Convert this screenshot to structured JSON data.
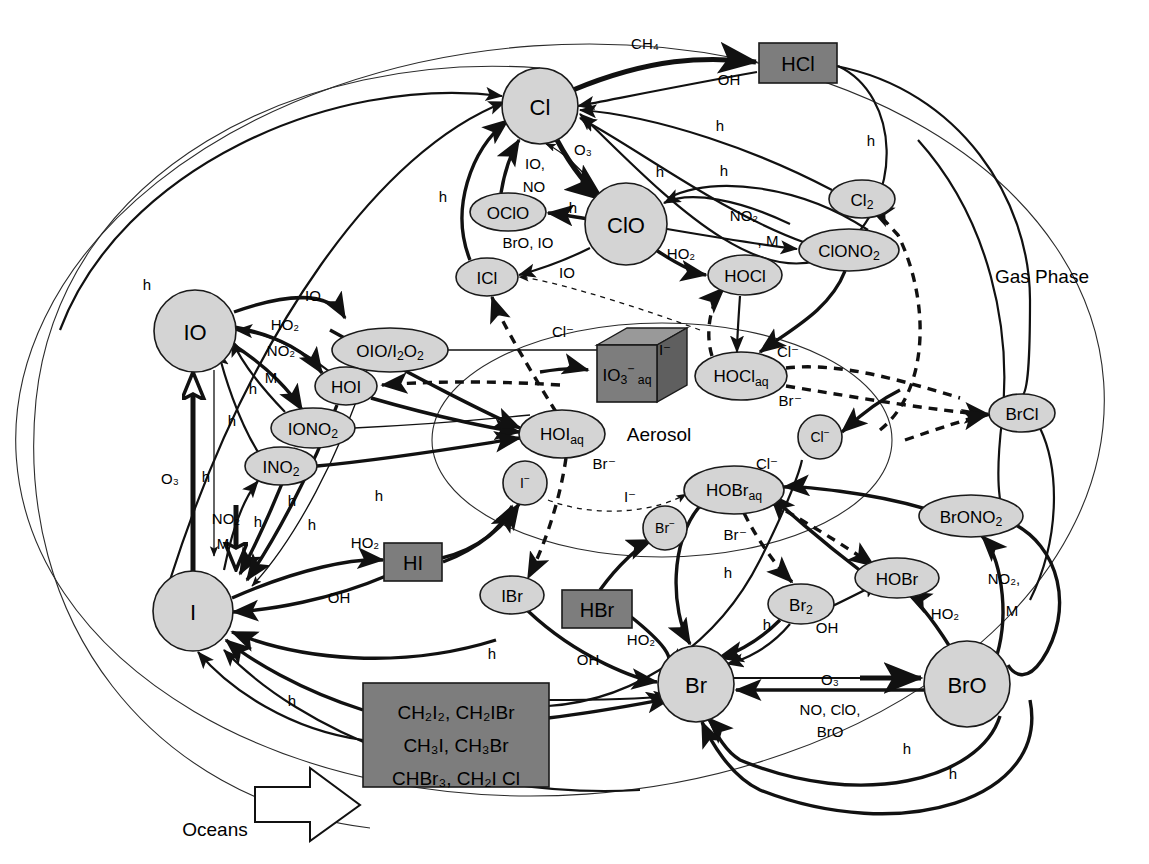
{
  "diagram": {
    "regions": [
      {
        "id": "gas_phase",
        "label": "Gas Phase",
        "x": 1042,
        "y": 276
      },
      {
        "id": "aerosol",
        "label": "Aerosol",
        "x": 659,
        "y": 434
      },
      {
        "id": "oceans",
        "label": "Oceans",
        "x": 215,
        "y": 829
      }
    ],
    "colors": {
      "node_light": "#d4d4d4",
      "node_dark": "#7d7d7d",
      "stroke": "#111111",
      "background": "#ffffff"
    },
    "nodes": [
      {
        "id": "Cl",
        "label": "Cl",
        "shape": "circle",
        "x": 540,
        "y": 106,
        "rx": 38,
        "ry": 38,
        "tone": "light"
      },
      {
        "id": "ClO",
        "label": "ClO",
        "shape": "circle",
        "x": 626,
        "y": 224,
        "rx": 41,
        "ry": 41,
        "tone": "light"
      },
      {
        "id": "OClO",
        "label": "OClO",
        "shape": "ellipse",
        "x": 508,
        "y": 212,
        "rx": 38,
        "ry": 19,
        "tone": "light"
      },
      {
        "id": "ICl",
        "label": "ICl",
        "shape": "ellipse",
        "x": 487,
        "y": 277,
        "rx": 31,
        "ry": 19,
        "tone": "light"
      },
      {
        "id": "HCl",
        "label": "HCl",
        "shape": "box",
        "x": 798,
        "y": 63,
        "rx": 39,
        "ry": 20,
        "tone": "dark"
      },
      {
        "id": "Cl2",
        "label": "Cl₂",
        "shape": "ellipse",
        "x": 862,
        "y": 199,
        "rx": 33,
        "ry": 19,
        "tone": "light"
      },
      {
        "id": "ClONO2",
        "label": "ClONO₂",
        "shape": "ellipse",
        "x": 849,
        "y": 250,
        "rx": 48,
        "ry": 21,
        "tone": "light"
      },
      {
        "id": "HOCl",
        "label": "HOCl",
        "shape": "ellipse",
        "x": 745,
        "y": 275,
        "rx": 37,
        "ry": 20,
        "tone": "light"
      },
      {
        "id": "HOClaq",
        "label": "HOCl_aq",
        "shape": "ellipse",
        "x": 741,
        "y": 376,
        "rx": 45,
        "ry": 23,
        "tone": "light"
      },
      {
        "id": "Clminus",
        "label": "Cl⁻",
        "shape": "circle",
        "x": 820,
        "y": 437,
        "rx": 22,
        "ry": 22,
        "tone": "light"
      },
      {
        "id": "IO",
        "label": "IO",
        "shape": "circle",
        "x": 195,
        "y": 331,
        "rx": 41,
        "ry": 41,
        "tone": "light"
      },
      {
        "id": "I",
        "label": "I",
        "shape": "circle",
        "x": 193,
        "y": 611,
        "rx": 40,
        "ry": 40,
        "tone": "light"
      },
      {
        "id": "OIO_I2O2",
        "label": "OIO/I₂O₂",
        "shape": "ellipse",
        "x": 390,
        "y": 350,
        "rx": 57,
        "ry": 22,
        "tone": "light"
      },
      {
        "id": "HOI",
        "label": "HOI",
        "shape": "ellipse",
        "x": 346,
        "y": 386,
        "rx": 31,
        "ry": 19,
        "tone": "light"
      },
      {
        "id": "IONO2",
        "label": "IONO₂",
        "shape": "ellipse",
        "x": 313,
        "y": 428,
        "rx": 41,
        "ry": 20,
        "tone": "light"
      },
      {
        "id": "INO2",
        "label": "INO₂",
        "shape": "ellipse",
        "x": 281,
        "y": 466,
        "rx": 36,
        "ry": 19,
        "tone": "light"
      },
      {
        "id": "HI",
        "label": "HI",
        "shape": "box",
        "x": 413,
        "y": 562,
        "rx": 29,
        "ry": 19,
        "tone": "dark"
      },
      {
        "id": "HOIaq",
        "label": "HOI_aq",
        "shape": "ellipse",
        "x": 562,
        "y": 434,
        "rx": 42,
        "ry": 23,
        "tone": "light"
      },
      {
        "id": "IO3aq",
        "label": "IO₃⁻_aq",
        "shape": "cube",
        "x": 637,
        "y": 375,
        "rx": 50,
        "ry": 26,
        "tone": "dark"
      },
      {
        "id": "Iminus",
        "label": "I⁻",
        "shape": "circle",
        "x": 525,
        "y": 483,
        "rx": 22,
        "ry": 22,
        "tone": "light"
      },
      {
        "id": "IBr",
        "label": "IBr",
        "shape": "ellipse",
        "x": 512,
        "y": 595,
        "rx": 32,
        "ry": 19,
        "tone": "light"
      },
      {
        "id": "Br",
        "label": "Br",
        "shape": "circle",
        "x": 696,
        "y": 684,
        "rx": 38,
        "ry": 38,
        "tone": "light"
      },
      {
        "id": "BrO",
        "label": "BrO",
        "shape": "circle",
        "x": 967,
        "y": 684,
        "rx": 43,
        "ry": 43,
        "tone": "light"
      },
      {
        "id": "Br2",
        "label": "Br₂",
        "shape": "ellipse",
        "x": 801,
        "y": 604,
        "rx": 33,
        "ry": 20,
        "tone": "light"
      },
      {
        "id": "HOBr",
        "label": "HOBr",
        "shape": "ellipse",
        "x": 897,
        "y": 578,
        "rx": 41,
        "ry": 20,
        "tone": "light"
      },
      {
        "id": "HOBraq",
        "label": "HOBr_aq",
        "shape": "ellipse",
        "x": 734,
        "y": 490,
        "rx": 49,
        "ry": 23,
        "tone": "light"
      },
      {
        "id": "BrONO2",
        "label": "BrONO₂",
        "shape": "ellipse",
        "x": 971,
        "y": 516,
        "rx": 50,
        "ry": 21,
        "tone": "light"
      },
      {
        "id": "BrCl",
        "label": "BrCl",
        "shape": "ellipse",
        "x": 1022,
        "y": 413,
        "rx": 33,
        "ry": 19,
        "tone": "light"
      },
      {
        "id": "Brminus",
        "label": "Br⁻",
        "shape": "circle",
        "x": 665,
        "y": 528,
        "rx": 22,
        "ry": 22,
        "tone": "light"
      },
      {
        "id": "HBr",
        "label": "HBr",
        "shape": "box",
        "x": 597,
        "y": 609,
        "rx": 34,
        "ry": 19,
        "tone": "dark"
      },
      {
        "id": "Organics",
        "label": "organic-halogen-source",
        "shape": "box",
        "x": 455,
        "y": 735,
        "rx": 92,
        "ry": 52,
        "tone": "dark"
      }
    ],
    "source_box_lines": [
      "CH₂I₂, CH₂IBr",
      "CH₃I, CH₃Br",
      "CHBr₃, CH₂I Cl"
    ],
    "edge_labels": [
      {
        "id": "ch4",
        "text": "CH₄",
        "x": 645,
        "y": 43
      },
      {
        "id": "oh_cl",
        "text": "OH",
        "x": 729,
        "y": 79
      },
      {
        "id": "h_cl_1",
        "text": "h",
        "x": 720,
        "y": 125
      },
      {
        "id": "h_cl_2",
        "text": "h",
        "x": 871,
        "y": 140
      },
      {
        "id": "o3_cl",
        "text": "O₃",
        "x": 583,
        "y": 149
      },
      {
        "id": "io_no",
        "text": "IO,",
        "x": 535,
        "y": 163
      },
      {
        "id": "no_cl",
        "text": "NO",
        "x": 534,
        "y": 186
      },
      {
        "id": "h_oclo",
        "text": "h",
        "x": 573,
        "y": 207
      },
      {
        "id": "bro_io",
        "text": "BrO, IO",
        "x": 528,
        "y": 242
      },
      {
        "id": "io_icl",
        "text": "IO",
        "x": 567,
        "y": 272
      },
      {
        "id": "h_clo_1",
        "text": "h",
        "x": 660,
        "y": 171
      },
      {
        "id": "h_clo_2",
        "text": "h",
        "x": 724,
        "y": 170
      },
      {
        "id": "no2_clono2",
        "text": "NO₂",
        "x": 744,
        "y": 215
      },
      {
        "id": "m_clono2",
        "text": ", M",
        "x": 768,
        "y": 240
      },
      {
        "id": "ho2_hocl",
        "text": "HO₂",
        "x": 681,
        "y": 253
      },
      {
        "id": "cl_minus_1",
        "text": "Cl⁻",
        "x": 563,
        "y": 331
      },
      {
        "id": "i_minus_1",
        "text": "I⁻",
        "x": 665,
        "y": 349
      },
      {
        "id": "cl_minus_2",
        "text": "Cl⁻",
        "x": 788,
        "y": 351
      },
      {
        "id": "br_minus_1",
        "text": "Br⁻",
        "x": 790,
        "y": 400
      },
      {
        "id": "io_oio",
        "text": "IO",
        "x": 313,
        "y": 295
      },
      {
        "id": "ho2_hoi",
        "text": "HO₂",
        "x": 285,
        "y": 324
      },
      {
        "id": "no2_iono2",
        "text": "NO₂",
        "x": 281,
        "y": 350
      },
      {
        "id": "m_iono2",
        "text": "M",
        "x": 271,
        "y": 377
      },
      {
        "id": "h_io_1",
        "text": "h",
        "x": 253,
        "y": 388
      },
      {
        "id": "h_io_2",
        "text": "h",
        "x": 232,
        "y": 420
      },
      {
        "id": "o3_io",
        "text": "O₃",
        "x": 170,
        "y": 478
      },
      {
        "id": "h_io_3",
        "text": "h",
        "x": 206,
        "y": 476
      },
      {
        "id": "no2_i",
        "text": "NO₂",
        "x": 226,
        "y": 518
      },
      {
        "id": "m_i",
        "text": "M",
        "x": 223,
        "y": 543
      },
      {
        "id": "h_i_1",
        "text": "h",
        "x": 258,
        "y": 521
      },
      {
        "id": "h_i_2",
        "text": "h",
        "x": 292,
        "y": 500
      },
      {
        "id": "h_i_3",
        "text": "h",
        "x": 312,
        "y": 524
      },
      {
        "id": "h_i_4",
        "text": "h",
        "x": 379,
        "y": 495
      },
      {
        "id": "ho2_hi",
        "text": "HO₂",
        "x": 365,
        "y": 542
      },
      {
        "id": "oh_i",
        "text": "OH",
        "x": 339,
        "y": 597
      },
      {
        "id": "h_far_left",
        "text": "h",
        "x": 147,
        "y": 284
      },
      {
        "id": "h_upper",
        "text": "h",
        "x": 443,
        "y": 196
      },
      {
        "id": "br_minus_2",
        "text": "Br⁻",
        "x": 604,
        "y": 463
      },
      {
        "id": "i_minus_2",
        "text": "I⁻",
        "x": 630,
        "y": 496
      },
      {
        "id": "cl_minus_3",
        "text": "Cl⁻",
        "x": 767,
        "y": 463
      },
      {
        "id": "br_minus_3",
        "text": "Br⁻",
        "x": 735,
        "y": 534
      },
      {
        "id": "h_br2",
        "text": "h",
        "x": 728,
        "y": 572
      },
      {
        "id": "h_br_oh",
        "text": "h",
        "x": 767,
        "y": 624
      },
      {
        "id": "oh_br2",
        "text": "OH",
        "x": 827,
        "y": 627
      },
      {
        "id": "ho2_hobr",
        "text": "HO₂",
        "x": 945,
        "y": 613
      },
      {
        "id": "no2_brono2",
        "text": "NO₂,",
        "x": 1004,
        "y": 578
      },
      {
        "id": "m_brono2",
        "text": "M",
        "x": 1012,
        "y": 610
      },
      {
        "id": "o3_bro",
        "text": "O₃",
        "x": 830,
        "y": 679
      },
      {
        "id": "no_clo",
        "text": "NO, ClO,",
        "x": 830,
        "y": 709
      },
      {
        "id": "bro_rev",
        "text": "BrO",
        "x": 830,
        "y": 731
      },
      {
        "id": "h_bot_1",
        "text": "h",
        "x": 907,
        "y": 748
      },
      {
        "id": "h_bot_2",
        "text": "h",
        "x": 953,
        "y": 773
      },
      {
        "id": "ho2_br",
        "text": "HO₂",
        "x": 641,
        "y": 639
      },
      {
        "id": "oh_hbr",
        "text": "OH",
        "x": 588,
        "y": 659
      },
      {
        "id": "h_ibr",
        "text": "h",
        "x": 492,
        "y": 653
      },
      {
        "id": "h_org",
        "text": "h",
        "x": 292,
        "y": 700
      }
    ]
  }
}
